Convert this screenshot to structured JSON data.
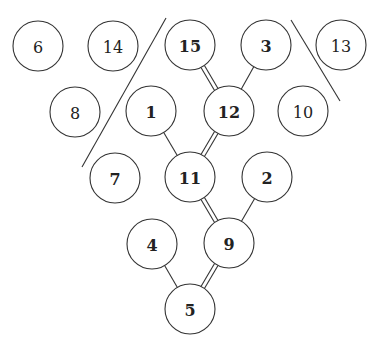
{
  "diagram": {
    "type": "tree-graph",
    "node_radius": 25,
    "nodes": [
      {
        "id": "6",
        "label": "6",
        "x": 38,
        "y": 46,
        "bold": false
      },
      {
        "id": "14",
        "label": "14",
        "x": 113,
        "y": 46,
        "bold": false
      },
      {
        "id": "15",
        "label": "15",
        "x": 190,
        "y": 45,
        "bold": true
      },
      {
        "id": "3",
        "label": "3",
        "x": 266,
        "y": 45,
        "bold": true
      },
      {
        "id": "13",
        "label": "13",
        "x": 341,
        "y": 45,
        "bold": false
      },
      {
        "id": "8",
        "label": "8",
        "x": 75,
        "y": 112,
        "bold": false
      },
      {
        "id": "1",
        "label": "1",
        "x": 151,
        "y": 111,
        "bold": true
      },
      {
        "id": "12",
        "label": "12",
        "x": 229,
        "y": 111,
        "bold": true
      },
      {
        "id": "10",
        "label": "10",
        "x": 303,
        "y": 111,
        "bold": false
      },
      {
        "id": "7",
        "label": "7",
        "x": 115,
        "y": 178,
        "bold": true
      },
      {
        "id": "11",
        "label": "11",
        "x": 190,
        "y": 177,
        "bold": true
      },
      {
        "id": "2",
        "label": "2",
        "x": 267,
        "y": 177,
        "bold": true
      },
      {
        "id": "4",
        "label": "4",
        "x": 152,
        "y": 244,
        "bold": true
      },
      {
        "id": "9",
        "label": "9",
        "x": 229,
        "y": 243,
        "bold": true
      },
      {
        "id": "5",
        "label": "5",
        "x": 190,
        "y": 309,
        "bold": true
      }
    ],
    "edges": [
      {
        "from": "15",
        "to": "12",
        "style": "double"
      },
      {
        "from": "3",
        "to": "12",
        "style": "single"
      },
      {
        "from": "1",
        "to": "11",
        "style": "single"
      },
      {
        "from": "12",
        "to": "11",
        "style": "double"
      },
      {
        "from": "11",
        "to": "9",
        "style": "double"
      },
      {
        "from": "2",
        "to": "9",
        "style": "single"
      },
      {
        "from": "4",
        "to": "5",
        "style": "single"
      },
      {
        "from": "9",
        "to": "5",
        "style": "double"
      }
    ],
    "separators": [
      {
        "name": "left-separator-line",
        "x1": 166,
        "y1": 18,
        "x2": 82,
        "y2": 167
      },
      {
        "name": "right-separator-line",
        "x1": 291,
        "y1": 20,
        "x2": 340,
        "y2": 101
      }
    ],
    "colors": {
      "stroke": "#333333",
      "text": "#222222",
      "background": "#ffffff"
    }
  }
}
